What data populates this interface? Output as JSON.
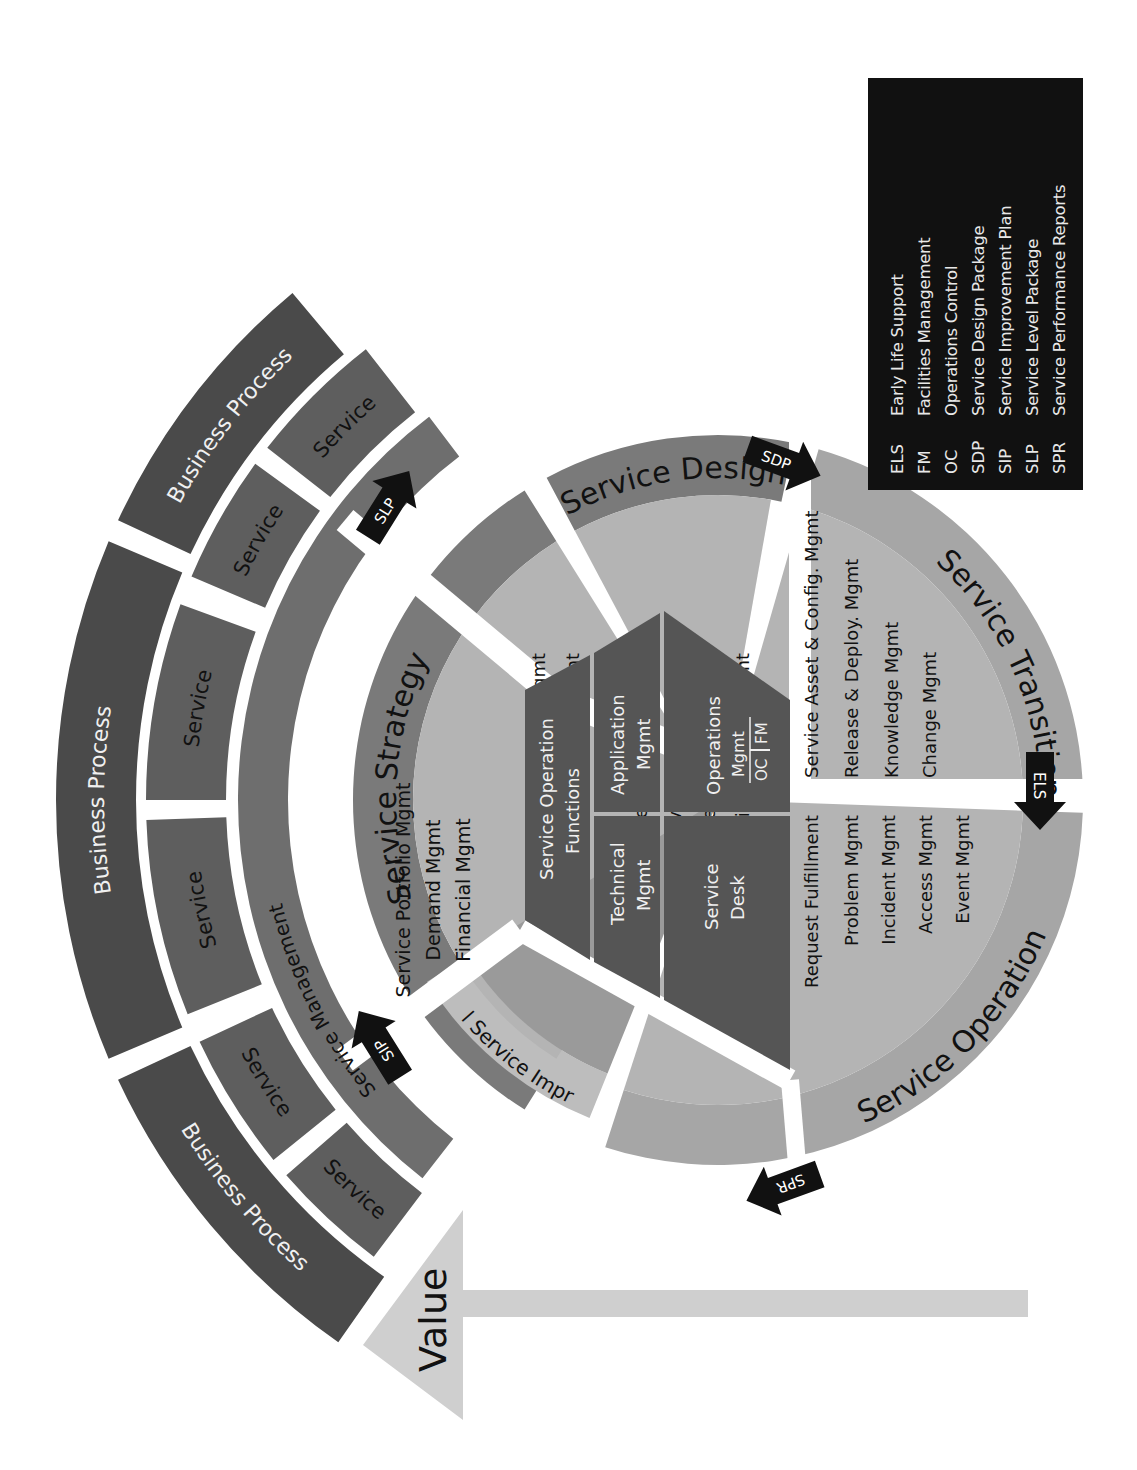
{
  "colors": {
    "business_process": "#4a4a4a",
    "service": "#5e5e5e",
    "service_management": "#6e6e6e",
    "phase_ring_dark": "#7a7a7a",
    "phase_ring_light": "#a6a6a6",
    "inner_light": "#b4b4b4",
    "inner_mid": "#9a9a9a",
    "hub": "#555555",
    "arrow": "#111111",
    "value_arrow": "#cfcfcf",
    "legend_bg": "#111111"
  },
  "outer_rings": {
    "business_process": [
      {
        "label": "Business Process",
        "a0": -130,
        "a1": -155
      },
      {
        "label": "Business Process",
        "a0": -157,
        "a1": -203
      },
      {
        "label": "Business Process",
        "a0": -205,
        "a1": -235
      }
    ],
    "services": [
      {
        "label": "Service",
        "a0": -128,
        "a1": -142
      },
      {
        "label": "Service",
        "a0": -144,
        "a1": -157
      },
      {
        "label": "Service",
        "a0": -160,
        "a1": -180
      },
      {
        "label": "Service",
        "a0": -182,
        "a1": -202
      },
      {
        "label": "Service",
        "a0": -205,
        "a1": -219
      },
      {
        "label": "Service",
        "a0": -221,
        "a1": -233
      }
    ],
    "service_management": {
      "label": "Service Management",
      "a0": -127,
      "a1": -232
    }
  },
  "phases": {
    "strategy": {
      "title": "Service Strategy",
      "processes": [
        "Service Portfolio Mgmt",
        "Demand Mgmt",
        "Financial Mgmt"
      ]
    },
    "design": {
      "title": "Service Design",
      "processes": [
        "Supplier Mgmt",
        "Capacity Mgmt",
        "Availability Mgmt",
        "Service Level Mgmt",
        "Service Catalog Mgmt",
        "IT Service Continuity Mgmt",
        "Information Security Mgmt"
      ]
    },
    "transition": {
      "title": "Service Transition",
      "processes": [
        "Service Asset & Config. Mgmt",
        "Release & Deploy. Mgmt",
        "Knowledge Mgmt",
        "Change Mgmt"
      ]
    },
    "operation": {
      "title": "Service Operation",
      "processes": [
        "Request Fulfillment",
        "Problem Mgmt",
        "Incident Mgmt",
        "Access Mgmt",
        "Event Mgmt"
      ]
    },
    "csi": {
      "title": "Continual Service Improvement"
    }
  },
  "hub": {
    "title_line1": "Service Operation",
    "title_line2": "Functions",
    "cells": {
      "technical": [
        "Technical",
        "Mgmt"
      ],
      "application": [
        "Application",
        "Mgmt"
      ],
      "service_desk": [
        "Service",
        "Desk"
      ],
      "operations": [
        "Operations",
        "Mgmt"
      ],
      "oc": "OC",
      "fm": "FM"
    }
  },
  "flow_arrows": [
    {
      "label": "SLP",
      "from": "Service Strategy",
      "to": "Service Design"
    },
    {
      "label": "SDP",
      "from": "Service Design",
      "to": "Service Transition"
    },
    {
      "label": "ELS",
      "from": "Service Transition",
      "to": "Service Operation"
    },
    {
      "label": "SPR",
      "from": "Service Operation",
      "to": "Continual Service Improvement"
    },
    {
      "label": "SIP",
      "from": "Continual Service Improvement",
      "to": "Service Strategy"
    }
  ],
  "value_arrow": {
    "label": "Value"
  },
  "legend": [
    {
      "abbr": "ELS",
      "full": "Early Life Support"
    },
    {
      "abbr": "FM",
      "full": "Facilities Management"
    },
    {
      "abbr": "OC",
      "full": "Operations Control"
    },
    {
      "abbr": "SDP",
      "full": "Service Design Package"
    },
    {
      "abbr": "SIP",
      "full": "Service Improvement Plan"
    },
    {
      "abbr": "SLP",
      "full": "Service Level Package"
    },
    {
      "abbr": "SPR",
      "full": "Service Performance Reports"
    }
  ]
}
